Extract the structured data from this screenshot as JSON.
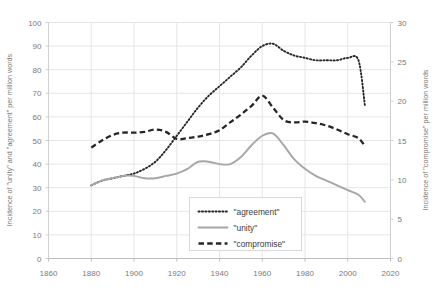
{
  "chart_data": {
    "type": "line",
    "title": "",
    "xlabel": "",
    "ylabel": "Incidence of \"unity\" and \"agreement\" per million words",
    "y2label": "Incidence of \"compromise\" per million words",
    "xlim": [
      1860,
      2020
    ],
    "ylim": [
      0,
      100
    ],
    "y2lim": [
      0,
      30
    ],
    "grid": true,
    "legend_position": "inside-bottom-center",
    "xticks": [
      1860,
      1880,
      1900,
      1920,
      1940,
      1960,
      1980,
      2000,
      2020
    ],
    "yticks": [
      0,
      10,
      20,
      30,
      40,
      50,
      60,
      70,
      80,
      90,
      100
    ],
    "y2ticks": [
      0,
      5,
      10,
      15,
      20,
      25,
      30
    ],
    "x": [
      1880,
      1885,
      1890,
      1895,
      1900,
      1905,
      1910,
      1915,
      1920,
      1925,
      1930,
      1935,
      1940,
      1945,
      1950,
      1955,
      1960,
      1965,
      1970,
      1975,
      1980,
      1985,
      1990,
      1995,
      2000,
      2005,
      2008
    ],
    "series": [
      {
        "name": "\"agreement\"",
        "axis": "left",
        "style": "dotted",
        "color": "#262626",
        "values": [
          31,
          33,
          34,
          35,
          36,
          38,
          41,
          46,
          52,
          58,
          64,
          69,
          73,
          77,
          81,
          86,
          90,
          91,
          88,
          86,
          85,
          84,
          84,
          84,
          85,
          84,
          65
        ]
      },
      {
        "name": "\"unity\"",
        "axis": "left",
        "style": "solid",
        "color": "#a6a6a6",
        "values": [
          31,
          33,
          34,
          35,
          35,
          34,
          34,
          35,
          36,
          38,
          41,
          41,
          40,
          40,
          43,
          48,
          52,
          53,
          48,
          42,
          38,
          35,
          33,
          31,
          29,
          27,
          24
        ]
      },
      {
        "name": "\"compromise\"",
        "axis": "right",
        "style": "dashed",
        "color": "#262626",
        "values": [
          14.1,
          15.0,
          15.7,
          16.0,
          16.0,
          16.1,
          16.4,
          16.1,
          15.2,
          15.3,
          15.5,
          15.8,
          16.3,
          17.3,
          18.3,
          19.4,
          20.7,
          19.2,
          17.6,
          17.3,
          17.4,
          17.2,
          16.9,
          16.4,
          15.8,
          15.3,
          14.3
        ]
      }
    ]
  },
  "legend": {
    "items": [
      {
        "label": "\"agreement\"",
        "style": "dotted"
      },
      {
        "label": "\"unity\"",
        "style": "solid"
      },
      {
        "label": "\"compromise\"",
        "style": "dashed"
      }
    ]
  }
}
